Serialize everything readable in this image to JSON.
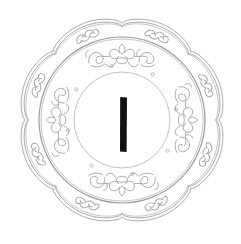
{
  "figure": {
    "central_glyph": "丨",
    "colors": {
      "background": "#ffffff",
      "line": "#a8a8a8",
      "glyph": "#111111"
    },
    "geometry": {
      "center": [
        122,
        120
      ],
      "outer_rim_radius": 103,
      "lobes": 8,
      "middle_ring_radius": 82,
      "inner_medallion_radius": 48,
      "glyph_box": [
        120,
        97,
        7,
        55
      ]
    }
  }
}
